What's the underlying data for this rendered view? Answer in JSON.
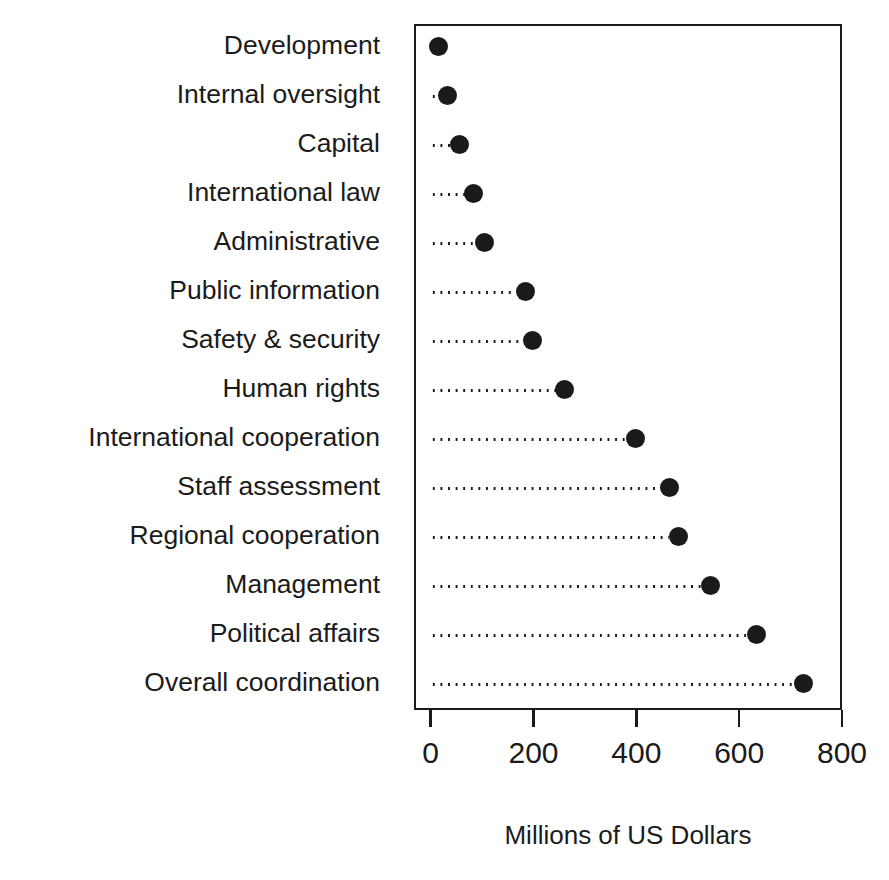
{
  "figure": {
    "top_artifact_text": "......, ... .. .... ....., ..",
    "background_color": "#ffffff",
    "ink_color": "#1a1a1a"
  },
  "chart_data": {
    "type": "scatter",
    "variant": "dot-plot",
    "title": "",
    "subtitle": "",
    "xlabel": "Millions of US Dollars",
    "ylabel": "",
    "orientation": "horizontal",
    "grid": false,
    "leader_lines": "dotted",
    "legend": null,
    "legend_position": "none",
    "marker": {
      "shape": "circle",
      "filled": true,
      "color": "#1a1a1a",
      "size_px": 19
    },
    "xlim": [
      0,
      800
    ],
    "xticks": [
      0,
      200,
      400,
      600,
      800
    ],
    "xtick_labels": [
      "0",
      "200",
      "400",
      "600",
      "800"
    ],
    "categories": [
      "Development",
      "Internal oversight",
      "Capital",
      "International law",
      "Administrative",
      "Public information",
      "Safety & security",
      "Human rights",
      "International cooperation",
      "Staff assessment",
      "Regional cooperation",
      "Management",
      "Political affairs",
      "Overall coordination"
    ],
    "values": [
      12,
      29,
      53,
      80,
      100,
      180,
      194,
      257,
      395,
      461,
      478,
      541,
      629,
      722
    ]
  }
}
